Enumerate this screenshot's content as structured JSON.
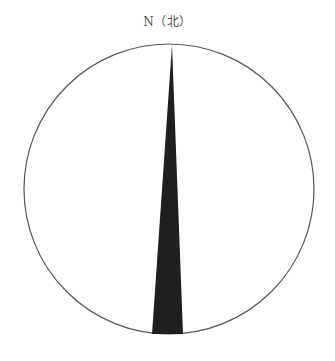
{
  "compass": {
    "north_label": "N（北）",
    "circle": {
      "cx": 169,
      "cy": 189,
      "r": 145,
      "stroke": "#555555"
    },
    "needle": {
      "tip": [
        172,
        45
      ],
      "base_left": [
        152,
        334
      ],
      "base_right": [
        183,
        334
      ],
      "fill": "#1f1f1f"
    }
  }
}
